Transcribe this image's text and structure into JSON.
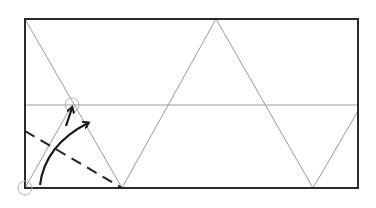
{
  "diagram": {
    "title": "",
    "type": "origami-fold-diagram",
    "colors": {
      "paper_edge": "#2a2a2a",
      "crease": "#9a9a9a",
      "valley_fold": "#222222",
      "arrow": "#1a1a1a",
      "reference_circle": "#b0b0b0",
      "background": "#ffffff"
    },
    "paper": {
      "x": 25,
      "y": 19,
      "width": 333,
      "height": 169
    },
    "horizontal_crease": {
      "y": 105
    },
    "zigzag_creases": [
      [
        25,
        19
      ],
      [
        122,
        188
      ],
      [
        216,
        19
      ],
      [
        313,
        188
      ],
      [
        358,
        111
      ]
    ],
    "extra_crease": {
      "from": [
        25,
        188
      ],
      "to": [
        72,
        105
      ]
    },
    "valley_fold_line": {
      "from": [
        25,
        131
      ],
      "to": [
        122,
        188
      ],
      "style": "dashed"
    },
    "reference_circles": [
      {
        "cx": 72,
        "cy": 105,
        "r": 7
      },
      {
        "cx": 25,
        "cy": 188,
        "r": 7
      }
    ],
    "arrows": [
      {
        "name": "fold-arrow-curved",
        "path": "M40 185 Q45 145 88 123"
      },
      {
        "name": "point-arrow-short",
        "path": "M66 124 L72 108"
      }
    ]
  }
}
